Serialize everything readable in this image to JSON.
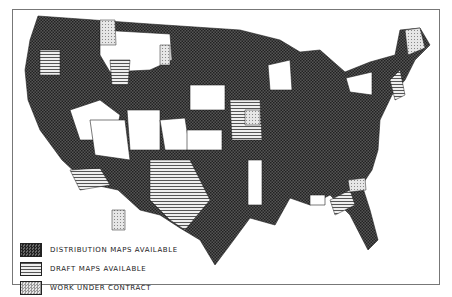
{
  "legend": {
    "items": [
      {
        "label": "DISTRIBUTION MAPS AVAILABLE",
        "pattern": "dark-checker"
      },
      {
        "label": "DRAFT MAPS AVAILABLE",
        "pattern": "horizontal-lines"
      },
      {
        "label": "WORK UNDER CONTRACT",
        "pattern": "light-dots"
      }
    ]
  },
  "colors": {
    "dark": "#3a3a3a",
    "mid": "#888888",
    "light": "#d8d8d8",
    "border": "#222222"
  }
}
